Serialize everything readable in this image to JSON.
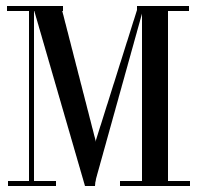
{
  "glyph": {
    "letter": "M",
    "color": "#000000",
    "background": "#ffffff",
    "style": "serif"
  }
}
